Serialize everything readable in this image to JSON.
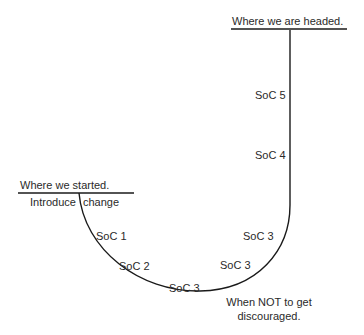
{
  "labels": {
    "headed": "Where we are headed.",
    "started": "Where we started.",
    "introduce": "Introduce",
    "change": "change",
    "soc1": "SoC 1",
    "soc2": "SoC 2",
    "soc3_bottom": "SoC 3",
    "soc3_mid": "SoC 3",
    "soc3_upper": "SoC 3",
    "soc4": "SoC 4",
    "soc5": "SoC 5",
    "discouraged_line1": "When NOT to get",
    "discouraged_line2": "discouraged."
  },
  "colors": {
    "line": "#1a1a1a",
    "text": "#2a2a2a"
  }
}
